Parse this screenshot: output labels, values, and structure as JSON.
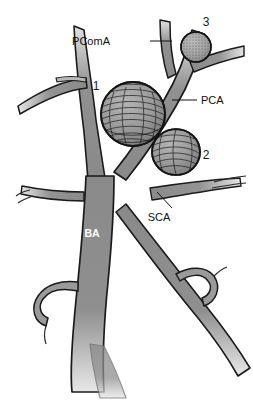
{
  "figure": {
    "background_color": "#ffffff",
    "vessel_fill": "#8a8a8a",
    "vessel_fill_light": "#cfcfcf",
    "vessel_outline": "#1a1a1a",
    "aneurysm_fill": "#9a9a9a",
    "aneurysm_hatch": "#1f1f1f",
    "label_color": "#111111",
    "inner_label_color": "#ffffff"
  },
  "labels": {
    "pcoma": "PComA",
    "pca": "PCA",
    "sca": "SCA",
    "ba": "BA"
  },
  "numerals": {
    "one": "1",
    "two": "2",
    "three": "3"
  },
  "aneurysms": [
    {
      "id": "1",
      "name": "basilar-apex-aneurysm",
      "label": "1",
      "size": "large",
      "texture": "line-hatch"
    },
    {
      "id": "2",
      "name": "sca-origin-aneurysm",
      "label": "2",
      "size": "medium",
      "texture": "line-hatch"
    },
    {
      "id": "3",
      "name": "pcoma-pca-junction-aneurysm",
      "label": "3",
      "size": "small",
      "texture": "stipple"
    }
  ],
  "vessels": [
    {
      "name": "basilar-artery",
      "abbr": "BA"
    },
    {
      "name": "posterior-cerebral-artery",
      "abbr": "PCA"
    },
    {
      "name": "posterior-communicating-artery",
      "abbr": "PComA"
    },
    {
      "name": "superior-cerebellar-artery",
      "abbr": "SCA"
    }
  ]
}
